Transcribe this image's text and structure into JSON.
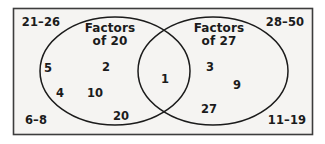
{
  "figure": {
    "type": "venn-diagram",
    "universe_border_color": "#3d3d3d",
    "ellipse_stroke_color": "#1b1b1b",
    "background_color": "#f5f4f2",
    "text_color": "#1b1b1b"
  },
  "sets": {
    "left": {
      "title_line1": "Factors",
      "title_line2": "of 20"
    },
    "right": {
      "title_line1": "Factors",
      "title_line2": "of 27"
    }
  },
  "members": {
    "left_only": [
      "5",
      "2",
      "4",
      "10",
      "20"
    ],
    "intersection": [
      "1"
    ],
    "right_only": [
      "3",
      "9",
      "27"
    ]
  },
  "corner_labels": {
    "top_left": "21–26",
    "top_right": "28–50",
    "bottom_left": "6–8",
    "bottom_right": "11–19"
  }
}
